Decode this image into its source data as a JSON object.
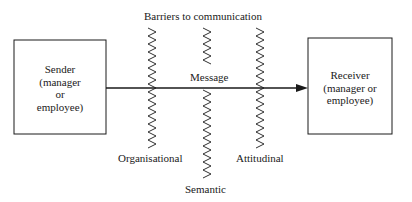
{
  "title": "Barriers to communication",
  "sender": {
    "label": "Sender\n(manager\nor\nemployee)"
  },
  "receiver": {
    "label": "Receiver\n(manager or\nemployee)"
  },
  "message_label": "Message",
  "barriers": [
    {
      "id": "organisational",
      "label": "Organisational"
    },
    {
      "id": "semantic",
      "label": "Semantic"
    },
    {
      "id": "attitudinal",
      "label": "Attitudinal"
    }
  ],
  "colors": {
    "ink": "#1a1a1a",
    "background": "#ffffff"
  }
}
